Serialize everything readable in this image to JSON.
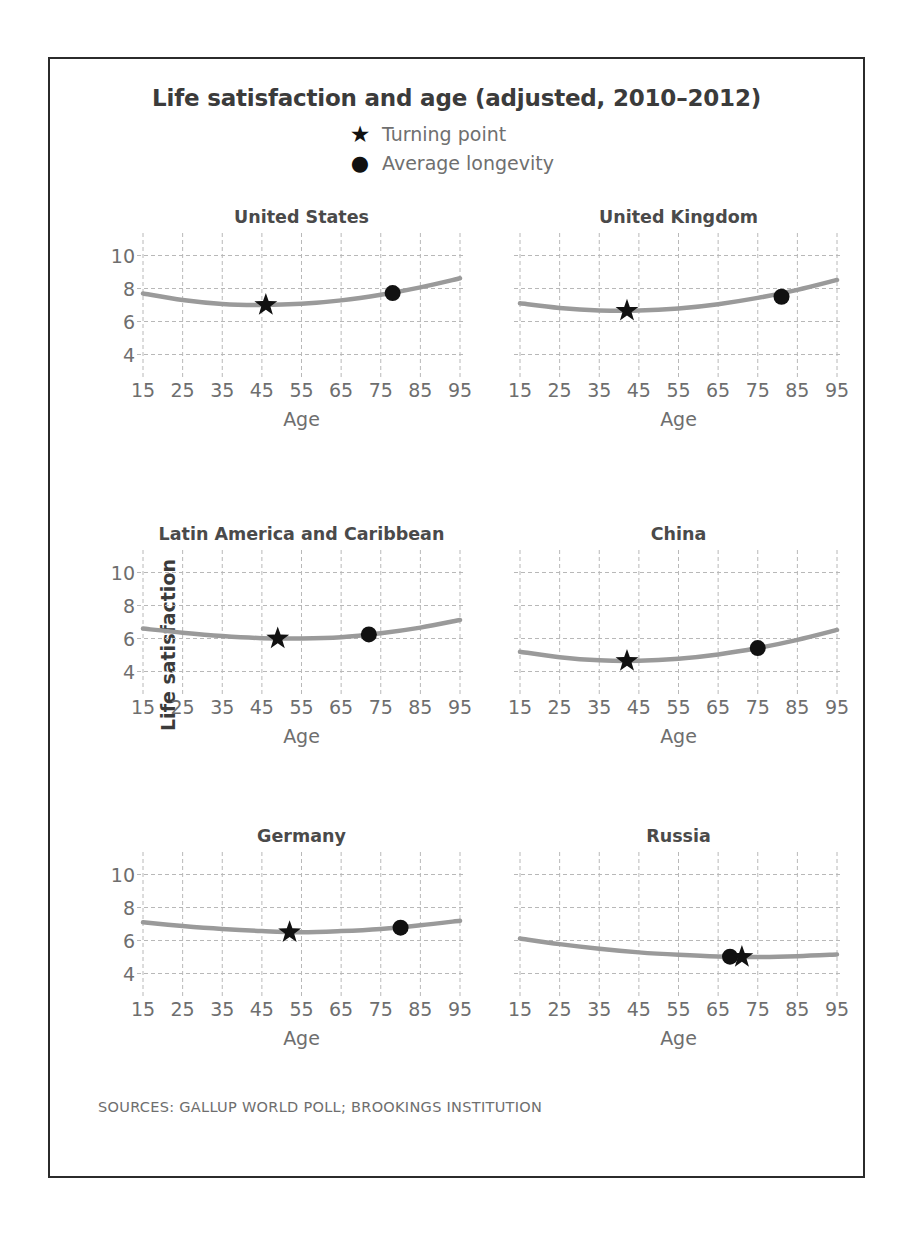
{
  "figure": {
    "title": "Life satisfaction and age (adjusted, 2010–2012)",
    "source": "SOURCES: GALLUP WORLD POLL; BROOKINGS INSTITUTION",
    "y_axis_title": "Life satisfaction",
    "x_axis_title": "Age",
    "border_color": "#2b2b2b",
    "line_color": "#9a9a9a",
    "marker_color": "#111111",
    "grid_color": "#b8b8b8",
    "text_color": "#6e6e6e"
  },
  "legend": {
    "position": "top-center",
    "entries": [
      {
        "marker": "star-icon",
        "glyph": "★",
        "label": "Turning point"
      },
      {
        "marker": "circle-icon",
        "glyph": "●",
        "label": "Average longevity"
      }
    ]
  },
  "chart_data": {
    "type": "line",
    "title": "Life satisfaction and age (adjusted, 2010–2012)",
    "xlabel": "Age",
    "ylabel": "Life satisfaction",
    "xlim": [
      15,
      95
    ],
    "ylim": [
      3,
      11
    ],
    "xticks": [
      15,
      25,
      35,
      45,
      55,
      65,
      75,
      85,
      95
    ],
    "yticks": [
      4,
      6,
      8,
      10
    ],
    "xticklabels": [
      "15",
      "25",
      "35",
      "45",
      "55",
      "65",
      "75",
      "85",
      "95"
    ],
    "yticklabels": [
      "10",
      "8",
      "6",
      "4"
    ],
    "grid": true,
    "grid_style": "dashed",
    "legend_position": "top-center",
    "panel_layout": {
      "rows": 3,
      "cols": 2
    },
    "panels": [
      {
        "name": "United States",
        "row": 0,
        "col": 0,
        "show_yticklabels": true,
        "x": [
          15,
          25,
          35,
          45,
          55,
          65,
          75,
          85,
          95
        ],
        "y": [
          7.7,
          7.3,
          7.06,
          7.0,
          7.07,
          7.28,
          7.62,
          8.07,
          8.62
        ],
        "turning_point": {
          "age": 46,
          "value": 7.0
        },
        "average_longevity": {
          "age": 78,
          "value": 7.72
        }
      },
      {
        "name": "United Kingdom",
        "row": 0,
        "col": 1,
        "show_yticklabels": false,
        "x": [
          15,
          25,
          35,
          45,
          55,
          65,
          75,
          85,
          95
        ],
        "y": [
          7.1,
          6.82,
          6.67,
          6.66,
          6.79,
          7.05,
          7.43,
          7.92,
          8.52
        ],
        "turning_point": {
          "age": 42,
          "value": 6.65
        },
        "average_longevity": {
          "age": 81,
          "value": 7.5
        }
      },
      {
        "name": "Latin America and Caribbean",
        "row": 1,
        "col": 0,
        "show_yticklabels": true,
        "x": [
          15,
          25,
          35,
          45,
          55,
          65,
          75,
          85,
          95
        ],
        "y": [
          6.6,
          6.35,
          6.15,
          6.02,
          6.0,
          6.08,
          6.32,
          6.66,
          7.12
        ],
        "turning_point": {
          "age": 49,
          "value": 6.0
        },
        "average_longevity": {
          "age": 72,
          "value": 6.25
        }
      },
      {
        "name": "China",
        "row": 1,
        "col": 1,
        "show_yticklabels": false,
        "x": [
          15,
          25,
          35,
          45,
          55,
          65,
          75,
          85,
          95
        ],
        "y": [
          5.2,
          4.87,
          4.68,
          4.65,
          4.77,
          5.03,
          5.42,
          5.92,
          6.52
        ],
        "turning_point": {
          "age": 42,
          "value": 4.64
        },
        "average_longevity": {
          "age": 75,
          "value": 5.42
        }
      },
      {
        "name": "Germany",
        "row": 2,
        "col": 0,
        "show_yticklabels": true,
        "x": [
          15,
          25,
          35,
          45,
          55,
          65,
          75,
          85,
          95
        ],
        "y": [
          7.1,
          6.88,
          6.7,
          6.57,
          6.5,
          6.57,
          6.7,
          6.92,
          7.2
        ],
        "turning_point": {
          "age": 52,
          "value": 6.5
        },
        "average_longevity": {
          "age": 80,
          "value": 6.78
        }
      },
      {
        "name": "Russia",
        "row": 2,
        "col": 1,
        "show_yticklabels": false,
        "x": [
          15,
          25,
          35,
          45,
          55,
          65,
          75,
          85,
          95
        ],
        "y": [
          6.12,
          5.78,
          5.5,
          5.28,
          5.13,
          5.03,
          5.0,
          5.05,
          5.15
        ],
        "turning_point": {
          "age": 71,
          "value": 5.0
        },
        "average_longevity": {
          "age": 68,
          "value": 5.02
        }
      }
    ]
  }
}
